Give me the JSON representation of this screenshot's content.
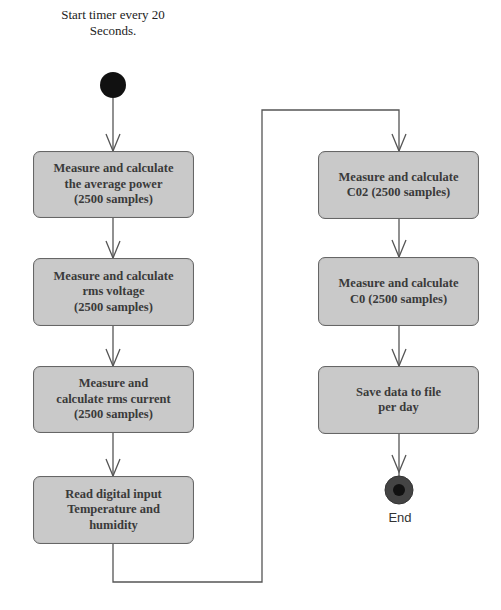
{
  "diagram": {
    "type": "flowchart",
    "start": {
      "label": "Start timer every 20\nSeconds."
    },
    "left_column": [
      {
        "id": "avg-power",
        "label": "Measure and calculate\nthe average power\n(2500 samples)"
      },
      {
        "id": "rms-voltage",
        "label": "Measure and calculate\nrms voltage\n(2500 samples)"
      },
      {
        "id": "rms-current",
        "label": "Measure and\ncalculate rms current\n(2500 samples)"
      },
      {
        "id": "digital-input",
        "label": "Read digital input\nTemperature and\nhumidity"
      }
    ],
    "right_column": [
      {
        "id": "co2",
        "label": "Measure and calculate\nC02 (2500 samples)"
      },
      {
        "id": "co",
        "label": "Measure and calculate\nC0 (2500 samples)"
      },
      {
        "id": "save",
        "label": "Save data to file\nper day"
      }
    ],
    "end": {
      "label": "End"
    },
    "edges": [
      [
        "start",
        "avg-power"
      ],
      [
        "avg-power",
        "rms-voltage"
      ],
      [
        "rms-voltage",
        "rms-current"
      ],
      [
        "rms-current",
        "digital-input"
      ],
      [
        "digital-input",
        "co2"
      ],
      [
        "co2",
        "co"
      ],
      [
        "co",
        "save"
      ],
      [
        "save",
        "end"
      ]
    ],
    "colors": {
      "box_fill": "#c9c9c9",
      "box_border": "#666666",
      "line": "#555555",
      "start_node": "#111111",
      "end_node": "#333333"
    }
  }
}
